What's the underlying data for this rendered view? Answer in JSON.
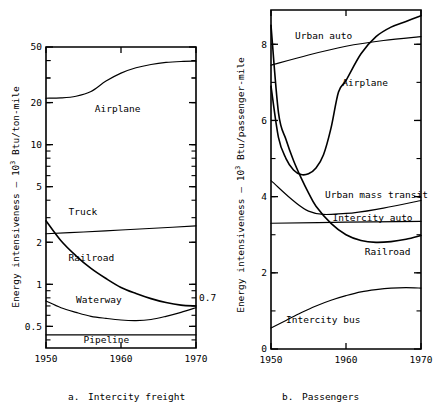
{
  "figure": {
    "panels": [
      {
        "id": "a",
        "caption_letter": "a.",
        "caption_text": "Intercity freight",
        "ylabel_main": "Energy intensiveness – 10",
        "ylabel_sup": "3",
        "ylabel_tail": " Btu/ton-mile",
        "end_annotation": "0.7"
      },
      {
        "id": "b",
        "caption_letter": "b.",
        "caption_text": "Passengers",
        "ylabel_main": "Energy intensiveness – 10",
        "ylabel_sup": "3",
        "ylabel_tail": " Btu/passenger-mile"
      }
    ]
  },
  "chart_data": [
    {
      "type": "line",
      "title": "a.  Intercity freight",
      "xlabel": "",
      "ylabel": "Energy intensiveness - 10^3 Btu/ton-mile",
      "yscale": "log",
      "xlim": [
        1950,
        1970
      ],
      "ylim": [
        0.35,
        50
      ],
      "xticks": [
        1950,
        1960,
        1970
      ],
      "xticklabels": [
        "1950",
        "1960",
        "1970"
      ],
      "yticks": [
        0.5,
        1,
        2,
        5,
        10,
        20,
        50
      ],
      "yticklabels": [
        "0.5",
        "1",
        "2",
        "5",
        "10",
        "20",
        "50"
      ],
      "grid": false,
      "legend": "inline-labels",
      "annotations": [
        {
          "text": "0.7",
          "x": 1970,
          "y": 0.7
        }
      ],
      "series": [
        {
          "name": "Airplane",
          "label_x": 1956.5,
          "label_y": 18.0,
          "x": [
            1950,
            1952,
            1954,
            1956,
            1958,
            1960,
            1962,
            1964,
            1966,
            1968,
            1970
          ],
          "values": [
            21.5,
            21.6,
            22.2,
            24.0,
            28.5,
            32.5,
            35.5,
            37.5,
            38.8,
            39.4,
            39.6
          ]
        },
        {
          "name": "Truck",
          "label_x": 1953.0,
          "label_y": 3.3,
          "x": [
            1950,
            1955,
            1960,
            1965,
            1970
          ],
          "values": [
            2.3,
            2.37,
            2.45,
            2.53,
            2.62
          ]
        },
        {
          "name": "Railroad",
          "label_x": 1953.0,
          "label_y": 1.55,
          "x": [
            1950,
            1952,
            1954,
            1956,
            1958,
            1960,
            1962,
            1964,
            1966,
            1968,
            1970
          ],
          "values": [
            2.85,
            2.05,
            1.6,
            1.3,
            1.1,
            0.95,
            0.86,
            0.79,
            0.74,
            0.71,
            0.7
          ]
        },
        {
          "name": "Waterway",
          "label_x": 1954.0,
          "label_y": 0.78,
          "x": [
            1950,
            1952,
            1954,
            1956,
            1958,
            1960,
            1962,
            1964,
            1966,
            1968,
            1970
          ],
          "values": [
            0.76,
            0.68,
            0.63,
            0.59,
            0.57,
            0.555,
            0.55,
            0.56,
            0.59,
            0.63,
            0.68
          ]
        },
        {
          "name": "Pipeline",
          "label_x": 1955.0,
          "label_y": 0.405,
          "x": [
            1950,
            1970
          ],
          "values": [
            0.435,
            0.435
          ]
        }
      ]
    },
    {
      "type": "line",
      "title": "b.  Passengers",
      "xlabel": "",
      "ylabel": "Energy intensiveness - 10^3 Btu/passenger-mile",
      "yscale": "linear",
      "xlim": [
        1950,
        1970
      ],
      "ylim": [
        0,
        8.9
      ],
      "xticks": [
        1950,
        1960,
        1970
      ],
      "xticklabels": [
        "1950",
        "1960",
        "1970"
      ],
      "yticks": [
        0,
        2,
        4,
        6,
        8
      ],
      "yticklabels": [
        "0",
        "2",
        "4",
        "6",
        "8"
      ],
      "grid": false,
      "legend": "inline-labels",
      "series": [
        {
          "name": "Urban auto",
          "label_x": 1953.2,
          "label_y": 8.22,
          "x": [
            1950,
            1955,
            1960,
            1965,
            1970
          ],
          "values": [
            7.45,
            7.72,
            7.95,
            8.1,
            8.2
          ]
        },
        {
          "name": "Airplane",
          "label_x": 1959.5,
          "label_y": 7.0,
          "x": [
            1950,
            1951,
            1952,
            1953,
            1954,
            1955,
            1956,
            1957,
            1958,
            1959,
            1960,
            1962,
            1964,
            1966,
            1968,
            1970
          ],
          "values": [
            6.9,
            5.55,
            5.0,
            4.7,
            4.58,
            4.6,
            4.75,
            5.1,
            5.8,
            6.75,
            7.05,
            7.75,
            8.2,
            8.45,
            8.6,
            8.75
          ]
        },
        {
          "name": "Urban mass transit",
          "label_x": 1957.2,
          "label_y": 4.05,
          "x": [
            1950,
            1955,
            1960,
            1965,
            1970
          ],
          "values": [
            4.42,
            3.62,
            3.56,
            3.7,
            3.9
          ]
        },
        {
          "name": "Intercity auto",
          "label_x": 1958.2,
          "label_y": 3.45,
          "x": [
            1950,
            1960,
            1970
          ],
          "values": [
            3.3,
            3.33,
            3.35
          ]
        },
        {
          "name": "Railroad",
          "label_x": 1962.5,
          "label_y": 2.55,
          "x": [
            1950,
            1951,
            1952,
            1953,
            1954,
            1955,
            1956,
            1958,
            1960,
            1962,
            1964,
            1966,
            1968,
            1970
          ],
          "values": [
            8.5,
            6.2,
            5.5,
            4.95,
            4.5,
            4.1,
            3.75,
            3.3,
            3.0,
            2.85,
            2.8,
            2.82,
            2.88,
            2.98
          ]
        },
        {
          "name": "Intercity bus",
          "label_x": 1952.0,
          "label_y": 0.78,
          "x": [
            1950,
            1952,
            1954,
            1956,
            1958,
            1960,
            1962,
            1964,
            1966,
            1968,
            1970
          ],
          "values": [
            0.55,
            0.75,
            0.95,
            1.13,
            1.28,
            1.4,
            1.5,
            1.56,
            1.6,
            1.61,
            1.6
          ]
        }
      ]
    }
  ]
}
